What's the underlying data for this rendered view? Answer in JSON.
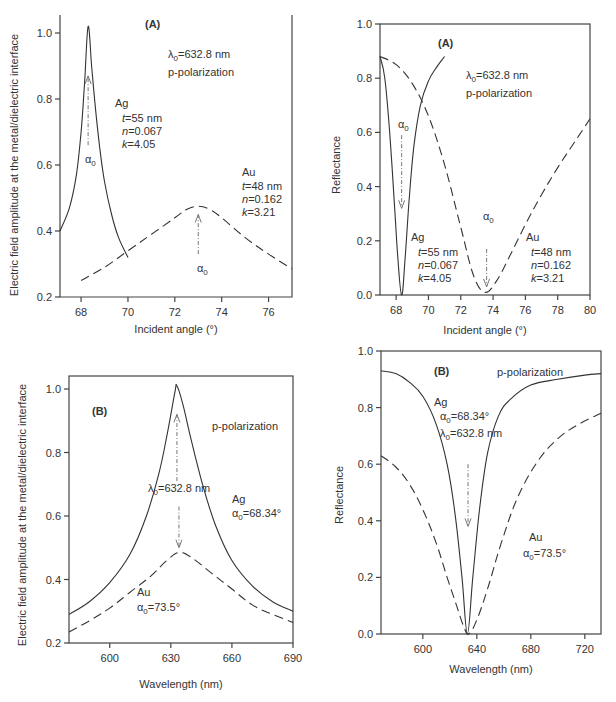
{
  "chart_data": [
    {
      "id": "top-left",
      "type": "line",
      "panel_label": "(A)",
      "xlabel": "Incident angle (°)",
      "ylabel": "Electric field amplitude at the metal/dielectric interface",
      "xlim": [
        67.1,
        77
      ],
      "ylim": [
        0.2,
        1.05
      ],
      "xticks": [
        68,
        70,
        72,
        74,
        76
      ],
      "yticks": [
        0.2,
        0.4,
        0.6,
        0.8,
        1.0
      ],
      "ytick_labels": [
        "0.2",
        "0.4",
        "0.6",
        "0.8",
        "1.0"
      ],
      "frame": "open-top",
      "box": {
        "x0": 60,
        "x1": 292,
        "y_top": 15,
        "y_axis_top": 33,
        "y_axis_bottom": 297
      },
      "series": [
        {
          "name": "Ag",
          "style": "solid",
          "x": [
            67.1,
            67.5,
            67.8,
            68.0,
            68.15,
            68.3,
            68.45,
            68.6,
            68.8,
            69.0,
            69.3,
            69.6,
            70.0
          ],
          "y": [
            0.4,
            0.47,
            0.57,
            0.7,
            0.85,
            1.02,
            0.9,
            0.78,
            0.65,
            0.55,
            0.45,
            0.38,
            0.32
          ]
        },
        {
          "name": "Au",
          "style": "dashed",
          "x": [
            68,
            69,
            70,
            71,
            72,
            72.5,
            73,
            73.5,
            74,
            75,
            76,
            77
          ],
          "y": [
            0.25,
            0.29,
            0.34,
            0.39,
            0.44,
            0.465,
            0.475,
            0.465,
            0.44,
            0.38,
            0.33,
            0.285
          ]
        }
      ],
      "arrows": [
        {
          "x": 68.3,
          "y_from": 0.66,
          "y_to": 0.87
        },
        {
          "x": 73.0,
          "y_from": 0.33,
          "y_to": 0.45
        }
      ],
      "annotations": [
        {
          "text": "(A)",
          "x": 145,
          "y": 28,
          "cls": "panel"
        },
        {
          "text": "λ0=632.8 nm",
          "x": 168,
          "y": 58,
          "sub": true
        },
        {
          "text": "p-polarization",
          "x": 168,
          "y": 76
        },
        {
          "text": "Ag",
          "x": 115,
          "y": 107
        },
        {
          "text": "t=55 nm",
          "x": 122,
          "y": 122,
          "italic_prefix": "t"
        },
        {
          "text": "n=0.067",
          "x": 122,
          "y": 135,
          "italic_prefix": "n"
        },
        {
          "text": "k=4.05",
          "x": 122,
          "y": 148,
          "italic_prefix": "k"
        },
        {
          "text": "α0",
          "x": 85,
          "y": 163,
          "sub": true
        },
        {
          "text": "Au",
          "x": 242,
          "y": 176
        },
        {
          "text": "t=48 nm",
          "x": 242,
          "y": 190,
          "italic_prefix": "t"
        },
        {
          "text": "n=0.162",
          "x": 242,
          "y": 203,
          "italic_prefix": "n"
        },
        {
          "text": "k=3.21",
          "x": 242,
          "y": 216,
          "italic_prefix": "k"
        },
        {
          "text": "α0",
          "x": 197,
          "y": 272,
          "sub": true
        }
      ]
    },
    {
      "id": "top-right",
      "type": "line",
      "panel_label": "(A)",
      "xlabel": "Incident angle (°)",
      "ylabel": "Reflectance",
      "xlim": [
        67,
        80
      ],
      "ylim": [
        0.0,
        1.0
      ],
      "xticks": [
        68,
        70,
        72,
        74,
        76,
        78,
        80
      ],
      "yticks": [
        0.0,
        0.2,
        0.4,
        0.6,
        0.8,
        1.0
      ],
      "ytick_labels": [
        "0.0",
        "0.2",
        "0.4",
        "0.6",
        "0.8",
        "1.0"
      ],
      "frame": "box",
      "box": {
        "x0": 380,
        "x1": 590,
        "y_top": 24,
        "y_axis_top": 24,
        "y_axis_bottom": 295
      },
      "series": [
        {
          "name": "Ag",
          "style": "solid",
          "x": [
            67,
            67.3,
            67.6,
            67.9,
            68.1,
            68.34,
            68.55,
            68.8,
            69.1,
            69.5,
            70.0,
            70.5,
            71.0
          ],
          "y": [
            0.88,
            0.8,
            0.6,
            0.33,
            0.14,
            0.0,
            0.13,
            0.35,
            0.55,
            0.7,
            0.79,
            0.84,
            0.88
          ]
        },
        {
          "name": "Au",
          "style": "dashed",
          "x": [
            67,
            68,
            69,
            70,
            71,
            72,
            72.8,
            73.5,
            74.2,
            75,
            76,
            77,
            78,
            79,
            80
          ],
          "y": [
            0.88,
            0.85,
            0.78,
            0.66,
            0.48,
            0.25,
            0.07,
            0.01,
            0.05,
            0.14,
            0.26,
            0.37,
            0.47,
            0.56,
            0.65
          ]
        }
      ],
      "arrows": [
        {
          "x": 68.34,
          "y_from": 0.59,
          "y_to": 0.32
        },
        {
          "x": 73.6,
          "y_from": 0.17,
          "y_to": 0.03
        }
      ],
      "annotations": [
        {
          "text": "(A)",
          "x": 438,
          "y": 47,
          "cls": "panel"
        },
        {
          "text": "λ0=632.8 nm",
          "x": 466,
          "y": 79,
          "sub": true
        },
        {
          "text": "p-polarization",
          "x": 466,
          "y": 97
        },
        {
          "text": "α0",
          "x": 398,
          "y": 128,
          "sub": true
        },
        {
          "text": "α0",
          "x": 483,
          "y": 220,
          "sub": true
        },
        {
          "text": "Ag",
          "x": 411,
          "y": 241
        },
        {
          "text": "t=55 nm",
          "x": 418,
          "y": 256,
          "italic_prefix": "t"
        },
        {
          "text": "n=0.067",
          "x": 418,
          "y": 269,
          "italic_prefix": "n"
        },
        {
          "text": "k=4.05",
          "x": 418,
          "y": 282,
          "italic_prefix": "k"
        },
        {
          "text": "Au",
          "x": 526,
          "y": 241
        },
        {
          "text": "t=48 nm",
          "x": 531,
          "y": 256,
          "italic_prefix": "t"
        },
        {
          "text": "n=0.162",
          "x": 531,
          "y": 269,
          "italic_prefix": "n"
        },
        {
          "text": "k=3.21",
          "x": 531,
          "y": 282,
          "italic_prefix": "k"
        }
      ]
    },
    {
      "id": "bottom-left",
      "type": "line",
      "panel_label": "(B)",
      "xlabel": "Wavelength (nm)",
      "ylabel": "Electric field amplitude at the metal/dielectric interface",
      "xlim": [
        580,
        690
      ],
      "ylim": [
        0.2,
        1.04
      ],
      "xticks": [
        600,
        630,
        660,
        690
      ],
      "yticks": [
        0.2,
        0.4,
        0.6,
        0.8,
        1.0
      ],
      "ytick_labels": [
        "0.2",
        "0.4",
        "0.6",
        "0.8",
        "1.0"
      ],
      "frame": "box",
      "box": {
        "x0": 69,
        "x1": 293,
        "y_top": 376,
        "y_axis_top": 389,
        "y_axis_bottom": 643
      },
      "series": [
        {
          "name": "Ag",
          "style": "solid",
          "x": [
            580,
            590,
            600,
            610,
            618,
            624,
            628,
            632,
            633,
            636,
            640,
            646,
            652,
            660,
            670,
            680,
            690
          ],
          "y": [
            0.29,
            0.33,
            0.39,
            0.48,
            0.6,
            0.73,
            0.85,
            0.99,
            1.01,
            0.95,
            0.84,
            0.69,
            0.57,
            0.46,
            0.38,
            0.33,
            0.3
          ]
        },
        {
          "name": "Au",
          "style": "dashed",
          "x": [
            580,
            590,
            600,
            610,
            620,
            628,
            634,
            640,
            650,
            660,
            670,
            680,
            690
          ],
          "y": [
            0.235,
            0.27,
            0.31,
            0.36,
            0.41,
            0.46,
            0.485,
            0.47,
            0.42,
            0.37,
            0.32,
            0.29,
            0.265
          ]
        }
      ],
      "arrows": [
        {
          "x": 633,
          "y_from": 0.71,
          "y_to": 0.92
        },
        {
          "x": 634,
          "y_from": 0.63,
          "y_to": 0.5
        }
      ],
      "annotations": [
        {
          "text": "(B)",
          "x": 92,
          "y": 415,
          "cls": "panel"
        },
        {
          "text": "p-polarization",
          "x": 212,
          "y": 430
        },
        {
          "text": "λ0=632.8 nm",
          "x": 148,
          "y": 492,
          "sub": true
        },
        {
          "text": "Ag",
          "x": 232,
          "y": 503
        },
        {
          "text": "α0=68.34°",
          "x": 232,
          "y": 517,
          "sub": true
        },
        {
          "text": "Au",
          "x": 137,
          "y": 596
        },
        {
          "text": "α0=73.5°",
          "x": 137,
          "y": 611,
          "sub": true
        }
      ]
    },
    {
      "id": "bottom-right",
      "type": "line",
      "panel_label": "(B)",
      "xlabel": "Wavelength (nm)",
      "ylabel": "Reflectance",
      "xlim": [
        569,
        732
      ],
      "ylim": [
        0.0,
        1.0
      ],
      "xticks": [
        600,
        640,
        680,
        720
      ],
      "yticks": [
        0.0,
        0.2,
        0.4,
        0.6,
        0.8,
        1.0
      ],
      "ytick_labels": [
        "0.0",
        "0.2",
        "0.4",
        "0.6",
        "0.8",
        "1.0"
      ],
      "frame": "box",
      "box": {
        "x0": 381,
        "x1": 601,
        "y_top": 351,
        "y_axis_top": 351,
        "y_axis_bottom": 634
      },
      "series": [
        {
          "name": "Ag",
          "style": "solid",
          "x": [
            569,
            580,
            590,
            600,
            610,
            618,
            624,
            629,
            633,
            637,
            642,
            648,
            656,
            665,
            680,
            700,
            720,
            732
          ],
          "y": [
            0.93,
            0.92,
            0.89,
            0.84,
            0.74,
            0.6,
            0.42,
            0.2,
            0.0,
            0.2,
            0.44,
            0.64,
            0.77,
            0.83,
            0.88,
            0.9,
            0.915,
            0.92
          ]
        },
        {
          "name": "Au",
          "style": "dashed",
          "x": [
            569,
            580,
            590,
            600,
            610,
            618,
            625,
            630,
            634,
            640,
            648,
            658,
            670,
            685,
            700,
            715,
            732
          ],
          "y": [
            0.63,
            0.59,
            0.53,
            0.44,
            0.32,
            0.2,
            0.1,
            0.03,
            0.0,
            0.05,
            0.16,
            0.32,
            0.48,
            0.61,
            0.69,
            0.74,
            0.78
          ]
        }
      ],
      "arrows": [
        {
          "x": 633.5,
          "y_from": 0.6,
          "y_to": 0.38
        }
      ],
      "annotations": [
        {
          "text": "(B)",
          "x": 434,
          "y": 375,
          "cls": "panel"
        },
        {
          "text": "p-polarization",
          "x": 497,
          "y": 376
        },
        {
          "text": "Ag",
          "x": 434,
          "y": 406
        },
        {
          "text": "α0=68.34°",
          "x": 440,
          "y": 420,
          "sub": true
        },
        {
          "text": "λ0=632.8 nm",
          "x": 440,
          "y": 437,
          "sub": true
        },
        {
          "text": "Au",
          "x": 529,
          "y": 541
        },
        {
          "text": "α0=73.5°",
          "x": 523,
          "y": 557,
          "sub": true
        }
      ]
    }
  ],
  "axis_labels": {
    "top_left_x": "Incident angle (°)",
    "top_right_x": "Incident angle (°)",
    "bottom_left_x": "Wavelength (nm)",
    "bottom_right_x": "Wavelength (nm)",
    "left_y": "Electric field amplitude at the metal/dielectric interface",
    "right_y": "Reflectance"
  }
}
